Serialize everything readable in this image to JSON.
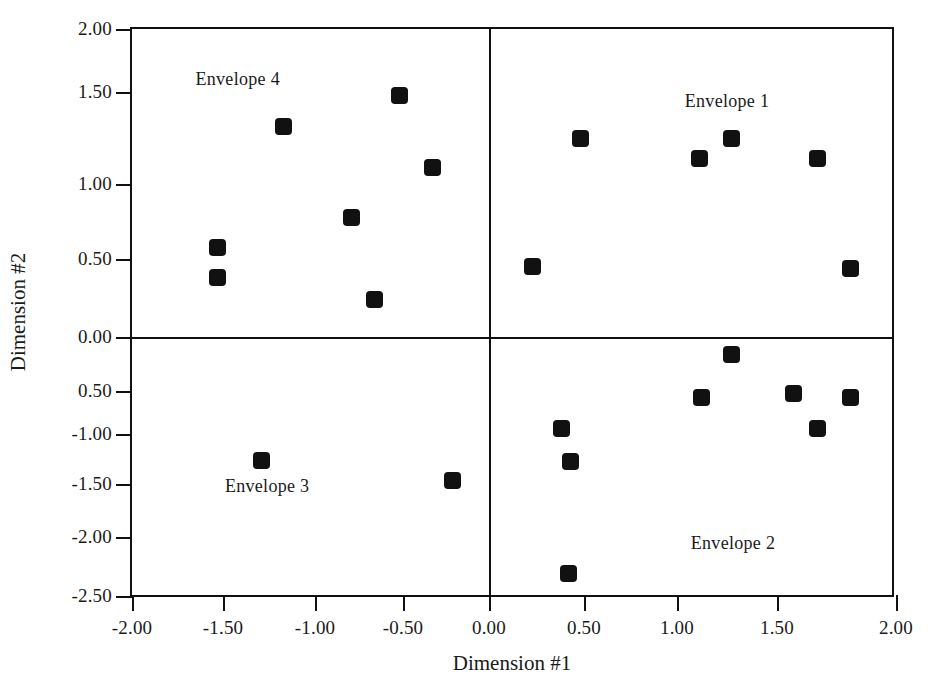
{
  "chart_data": {
    "type": "scatter",
    "title": "",
    "xlabel": "Dimension #1",
    "ylabel": "Dimension #2",
    "xlim": [
      -2.0,
      2.0
    ],
    "ylim": [
      -2.5,
      2.0
    ],
    "grid": false,
    "legend": "none",
    "xticks": [
      -2.0,
      -1.5,
      -1.0,
      -0.5,
      0.0,
      0.5,
      1.0,
      1.5,
      2.0
    ],
    "xticklabels": [
      "-2.00",
      "-1.50",
      "-1.00",
      "-0.50",
      "0.00",
      "0.50",
      "1.00",
      "1.50",
      "2.00"
    ],
    "yticks": [
      2.0,
      1.5,
      1.0,
      0.5,
      0.0,
      -0.5,
      -1.0,
      -1.5,
      -2.0,
      -2.5
    ],
    "yticklabels": [
      "2.00",
      "1.50",
      "1.00",
      "0.50",
      "0.00",
      "0.50",
      "-1.00",
      "-1.50",
      "-2.00",
      "-2.50"
    ],
    "reference_lines": [
      {
        "axis": "x",
        "value": 0.0
      },
      {
        "axis": "y",
        "value": 0.0
      }
    ],
    "annotations": [
      {
        "text": "Envelope 1",
        "x": 1.25,
        "y": 1.45
      },
      {
        "text": "Envelope 2",
        "x": 1.28,
        "y": -2.05
      },
      {
        "text": "Envelope 3",
        "x": -1.26,
        "y": -1.52
      },
      {
        "text": "Envelope 4",
        "x": -1.42,
        "y": 1.6
      }
    ],
    "series": [
      {
        "name": "Envelope 4",
        "quadrant": "upper-left",
        "marker": "square",
        "color": "#111111",
        "points": [
          {
            "x": -0.52,
            "y": 1.48
          },
          {
            "x": -1.17,
            "y": 1.31
          },
          {
            "x": -0.33,
            "y": 1.09
          },
          {
            "x": -0.79,
            "y": 0.78
          },
          {
            "x": -1.53,
            "y": 0.58
          },
          {
            "x": -1.53,
            "y": 0.38
          },
          {
            "x": -0.66,
            "y": 0.24
          }
        ]
      },
      {
        "name": "Envelope 1",
        "quadrant": "upper-right",
        "marker": "square",
        "color": "#111111",
        "points": [
          {
            "x": 0.48,
            "y": 1.25
          },
          {
            "x": 1.27,
            "y": 1.25
          },
          {
            "x": 1.11,
            "y": 1.14
          },
          {
            "x": 1.67,
            "y": 1.14
          },
          {
            "x": 0.23,
            "y": 0.45
          },
          {
            "x": 1.81,
            "y": 0.44
          }
        ]
      },
      {
        "name": "Envelope 3",
        "quadrant": "lower-left",
        "marker": "square",
        "color": "#111111",
        "points": [
          {
            "x": -1.29,
            "y": -1.26
          },
          {
            "x": -0.21,
            "y": -1.46
          }
        ]
      },
      {
        "name": "Envelope 2",
        "quadrant": "lower-right",
        "marker": "square",
        "color": "#111111",
        "points": [
          {
            "x": 1.27,
            "y": -0.16
          },
          {
            "x": 1.57,
            "y": -0.53
          },
          {
            "x": 1.12,
            "y": -0.57
          },
          {
            "x": 1.81,
            "y": -0.58
          },
          {
            "x": 0.38,
            "y": -0.94
          },
          {
            "x": 1.67,
            "y": -0.94
          },
          {
            "x": 0.43,
            "y": -1.27
          },
          {
            "x": 0.42,
            "y": -2.31
          }
        ]
      }
    ]
  },
  "pixel_layout": {
    "plot_left": 130,
    "plot_top": 27,
    "plot_width": 764,
    "plot_height": 570,
    "x_map": [
      {
        "v": -2.0,
        "px": 0
      },
      {
        "v": -1.5,
        "px": 91
      },
      {
        "v": -1.0,
        "px": 183
      },
      {
        "v": -0.5,
        "px": 271
      },
      {
        "v": 0.0,
        "px": 357
      },
      {
        "v": 0.5,
        "px": 452
      },
      {
        "v": 1.0,
        "px": 545
      },
      {
        "v": 1.5,
        "px": 645
      },
      {
        "v": 2.0,
        "px": 764
      }
    ],
    "y_map": [
      {
        "v": 2.0,
        "px": 0
      },
      {
        "v": 1.5,
        "px": 63
      },
      {
        "v": 1.0,
        "px": 155
      },
      {
        "v": 0.5,
        "px": 230
      },
      {
        "v": 0.0,
        "px": 308
      },
      {
        "v": -0.5,
        "px": 362
      },
      {
        "v": -1.0,
        "px": 405
      },
      {
        "v": -1.5,
        "px": 455
      },
      {
        "v": -2.0,
        "px": 508
      },
      {
        "v": -2.5,
        "px": 567
      }
    ]
  }
}
